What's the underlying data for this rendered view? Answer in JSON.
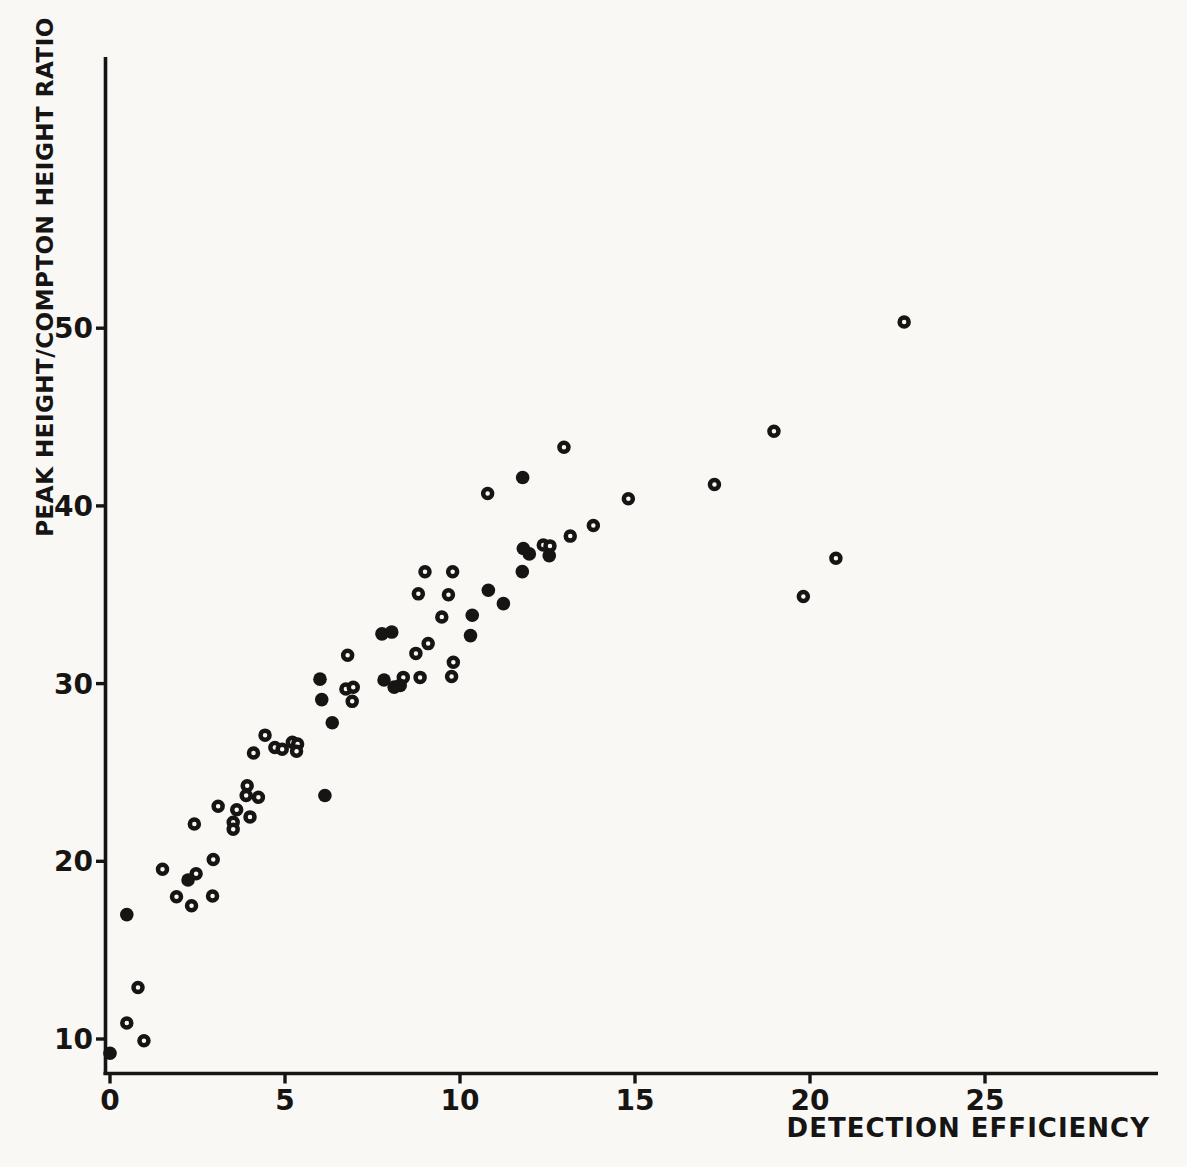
{
  "page": {
    "paper_color": "#f9f8f5",
    "ink_color": "#161514"
  },
  "chart_data": {
    "type": "scatter",
    "title": "",
    "xlabel": "DETECTION EFFICIENCY",
    "ylabel": "PEAK HEIGHT/COMPTON HEIGHT RATIO",
    "x_ticks": [
      0,
      5,
      10,
      15,
      20,
      25
    ],
    "y_ticks": [
      10,
      20,
      30,
      40,
      50
    ],
    "xlim": [
      0,
      30
    ],
    "ylim": [
      8,
      65
    ],
    "grid": false,
    "legend": "none",
    "series": [
      {
        "name": "open-circle-points",
        "marker": "open",
        "points": [
          [
            0.48,
            10.9
          ],
          [
            0.97,
            9.9
          ],
          [
            0.8,
            12.9
          ],
          [
            1.5,
            19.55
          ],
          [
            1.9,
            18.0
          ],
          [
            2.46,
            19.3
          ],
          [
            2.33,
            17.5
          ],
          [
            2.93,
            18.05
          ],
          [
            2.95,
            20.1
          ],
          [
            2.41,
            22.1
          ],
          [
            3.09,
            23.1
          ],
          [
            3.52,
            22.2
          ],
          [
            3.52,
            21.8
          ],
          [
            3.62,
            22.9
          ],
          [
            3.92,
            24.25
          ],
          [
            3.89,
            23.7
          ],
          [
            4.0,
            22.5
          ],
          [
            4.24,
            23.6
          ],
          [
            4.1,
            26.1
          ],
          [
            4.43,
            27.1
          ],
          [
            4.71,
            26.4
          ],
          [
            4.92,
            26.3
          ],
          [
            5.21,
            26.7
          ],
          [
            5.36,
            26.6
          ],
          [
            5.33,
            26.2
          ],
          [
            6.74,
            29.7
          ],
          [
            6.92,
            29.0
          ],
          [
            6.95,
            29.8
          ],
          [
            6.79,
            31.6
          ],
          [
            8.38,
            30.35
          ],
          [
            8.74,
            31.7
          ],
          [
            8.86,
            30.35
          ],
          [
            9.09,
            32.25
          ],
          [
            9.48,
            33.75
          ],
          [
            9.67,
            35.0
          ],
          [
            9.76,
            30.4
          ],
          [
            9.81,
            31.2
          ],
          [
            8.81,
            35.05
          ],
          [
            9.0,
            36.3
          ],
          [
            9.79,
            36.3
          ],
          [
            10.79,
            40.7
          ],
          [
            12.38,
            37.8
          ],
          [
            12.57,
            37.75
          ],
          [
            13.15,
            38.3
          ],
          [
            13.81,
            38.9
          ],
          [
            14.81,
            40.4
          ],
          [
            12.97,
            43.3
          ],
          [
            17.27,
            41.2
          ],
          [
            18.97,
            44.2
          ],
          [
            19.81,
            34.9
          ],
          [
            20.74,
            37.05
          ],
          [
            22.69,
            50.35
          ]
        ]
      },
      {
        "name": "filled-circle-points",
        "marker": "filled",
        "points": [
          [
            0.0,
            9.2
          ],
          [
            0.48,
            17.0
          ],
          [
            2.23,
            18.95
          ],
          [
            6.14,
            23.7
          ],
          [
            6.05,
            29.1
          ],
          [
            6.0,
            30.25
          ],
          [
            6.35,
            27.8
          ],
          [
            7.77,
            32.8
          ],
          [
            7.83,
            30.2
          ],
          [
            8.05,
            32.9
          ],
          [
            8.12,
            29.8
          ],
          [
            8.29,
            29.9
          ],
          [
            10.3,
            32.7
          ],
          [
            10.35,
            33.85
          ],
          [
            10.81,
            35.25
          ],
          [
            11.24,
            34.5
          ],
          [
            11.78,
            36.3
          ],
          [
            11.81,
            37.6
          ],
          [
            11.98,
            37.3
          ],
          [
            12.55,
            37.2
          ],
          [
            11.79,
            41.6
          ]
        ]
      }
    ]
  }
}
